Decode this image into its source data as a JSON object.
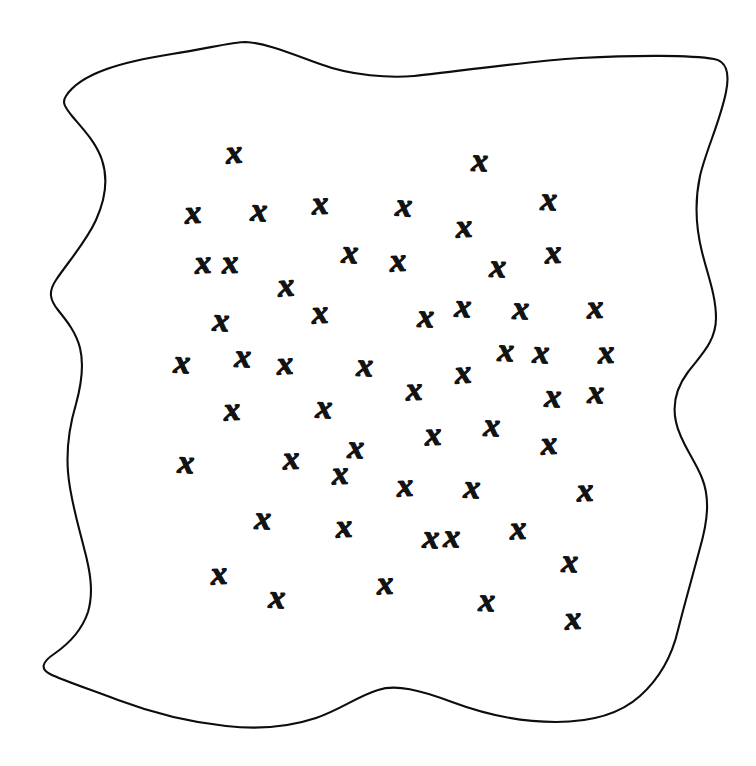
{
  "figure": {
    "name": "scattered-x-marks-in-irregular-region",
    "caption": "",
    "background_color": "#ffffff",
    "ink_color": "#121212",
    "outline_color": "#0d0d0d",
    "canvas": {
      "width": 756,
      "height": 766
    },
    "outline": {
      "name": "hand-drawn-closed-blob-boundary",
      "stroke_width": 2.1,
      "closed": true,
      "path": "M 66,96 C 80,74 120,62 172,54 C 210,48 232,42 246,42 C 266,43 292,54 320,64 C 352,76 390,78 414,76 C 452,72 520,62 580,58 C 636,55 692,55 714,59 C 726,61 730,72 726,92 C 720,122 706,150 700,176 C 694,204 696,228 702,252 C 708,276 716,296 716,318 C 716,342 700,356 688,372 C 676,388 672,404 676,422 C 680,442 694,458 702,478 C 710,498 708,520 700,548 C 692,578 684,606 678,630 C 672,656 660,678 640,696 C 620,714 590,722 556,722 C 520,722 484,714 452,702 C 420,690 396,684 378,690 C 358,696 340,710 316,718 C 292,726 262,730 226,726 C 188,722 150,712 118,700 C 86,688 62,680 50,674 C 40,669 42,662 54,654 C 70,643 82,630 88,612 C 94,592 90,570 84,548 C 78,524 70,498 68,472 C 66,446 70,424 76,404 C 82,382 84,364 80,348 C 76,332 66,320 58,310 C 50,300 48,292 56,280 C 68,262 86,242 96,220 C 106,198 108,178 102,160 C 96,142 82,128 72,116 C 64,106 62,102 66,96 Z"
    },
    "mark": {
      "glyph": "x",
      "semantic_name": "x-mark",
      "style": "hand-drawn-italic",
      "count": 55
    },
    "marks": [
      {
        "x": 234,
        "y": 152,
        "size": 33,
        "rot": -4
      },
      {
        "x": 480,
        "y": 160,
        "size": 34,
        "rot": 2
      },
      {
        "x": 193,
        "y": 212,
        "size": 33,
        "rot": -3
      },
      {
        "x": 259,
        "y": 210,
        "size": 33,
        "rot": 3
      },
      {
        "x": 320,
        "y": 203,
        "size": 34,
        "rot": -2
      },
      {
        "x": 404,
        "y": 205,
        "size": 33,
        "rot": 4
      },
      {
        "x": 464,
        "y": 226,
        "size": 31,
        "rot": -3
      },
      {
        "x": 549,
        "y": 199,
        "size": 34,
        "rot": 2
      },
      {
        "x": 230,
        "y": 262,
        "size": 33,
        "rot": -2
      },
      {
        "x": 350,
        "y": 252,
        "size": 34,
        "rot": 3
      },
      {
        "x": 286,
        "y": 285,
        "size": 32,
        "rot": -4
      },
      {
        "x": 498,
        "y": 266,
        "size": 33,
        "rot": 2
      },
      {
        "x": 221,
        "y": 320,
        "size": 32,
        "rot": 3
      },
      {
        "x": 320,
        "y": 312,
        "size": 33,
        "rot": -3
      },
      {
        "x": 426,
        "y": 316,
        "size": 33,
        "rot": 2
      },
      {
        "x": 595,
        "y": 307,
        "size": 34,
        "rot": -2
      },
      {
        "x": 182,
        "y": 362,
        "size": 33,
        "rot": 3
      },
      {
        "x": 285,
        "y": 363,
        "size": 33,
        "rot": -3
      },
      {
        "x": 365,
        "y": 365,
        "size": 33,
        "rot": 2
      },
      {
        "x": 463,
        "y": 372,
        "size": 32,
        "rot": -4
      },
      {
        "x": 541,
        "y": 352,
        "size": 33,
        "rot": 3
      },
      {
        "x": 414,
        "y": 389,
        "size": 33,
        "rot": -2
      },
      {
        "x": 596,
        "y": 392,
        "size": 33,
        "rot": 2
      },
      {
        "x": 232,
        "y": 409,
        "size": 33,
        "rot": -3
      },
      {
        "x": 324,
        "y": 407,
        "size": 33,
        "rot": 3
      },
      {
        "x": 433,
        "y": 434,
        "size": 33,
        "rot": -2
      },
      {
        "x": 492,
        "y": 425,
        "size": 33,
        "rot": 2
      },
      {
        "x": 549,
        "y": 443,
        "size": 32,
        "rot": -3
      },
      {
        "x": 186,
        "y": 462,
        "size": 33,
        "rot": 3
      },
      {
        "x": 291,
        "y": 458,
        "size": 33,
        "rot": -2
      },
      {
        "x": 356,
        "y": 447,
        "size": 33,
        "rot": 2
      },
      {
        "x": 405,
        "y": 485,
        "size": 33,
        "rot": -3
      },
      {
        "x": 472,
        "y": 487,
        "size": 33,
        "rot": 3
      },
      {
        "x": 585,
        "y": 490,
        "size": 33,
        "rot": -2
      },
      {
        "x": 263,
        "y": 518,
        "size": 33,
        "rot": 2
      },
      {
        "x": 344,
        "y": 526,
        "size": 33,
        "rot": -3
      },
      {
        "x": 431,
        "y": 537,
        "size": 33,
        "rot": 3
      },
      {
        "x": 518,
        "y": 528,
        "size": 33,
        "rot": -2
      },
      {
        "x": 570,
        "y": 561,
        "size": 33,
        "rot": 2
      },
      {
        "x": 219,
        "y": 573,
        "size": 33,
        "rot": -3
      },
      {
        "x": 277,
        "y": 597,
        "size": 32,
        "rot": 3
      },
      {
        "x": 385,
        "y": 583,
        "size": 33,
        "rot": -2
      },
      {
        "x": 487,
        "y": 600,
        "size": 32,
        "rot": 2
      },
      {
        "x": 573,
        "y": 618,
        "size": 33,
        "rot": -3
      },
      {
        "x": 521,
        "y": 308,
        "size": 32,
        "rot": 2
      },
      {
        "x": 553,
        "y": 252,
        "size": 33,
        "rot": -2
      },
      {
        "x": 463,
        "y": 306,
        "size": 32,
        "rot": 3
      },
      {
        "x": 398,
        "y": 260,
        "size": 33,
        "rot": -3
      },
      {
        "x": 506,
        "y": 350,
        "size": 32,
        "rot": 2
      },
      {
        "x": 340,
        "y": 473,
        "size": 31,
        "rot": -2
      },
      {
        "x": 243,
        "y": 356,
        "size": 31,
        "rot": 2
      },
      {
        "x": 203,
        "y": 262,
        "size": 30,
        "rot": -3
      },
      {
        "x": 553,
        "y": 396,
        "size": 31,
        "rot": 3
      },
      {
        "x": 606,
        "y": 352,
        "size": 31,
        "rot": -2
      },
      {
        "x": 452,
        "y": 536,
        "size": 31,
        "rot": 2
      }
    ]
  }
}
